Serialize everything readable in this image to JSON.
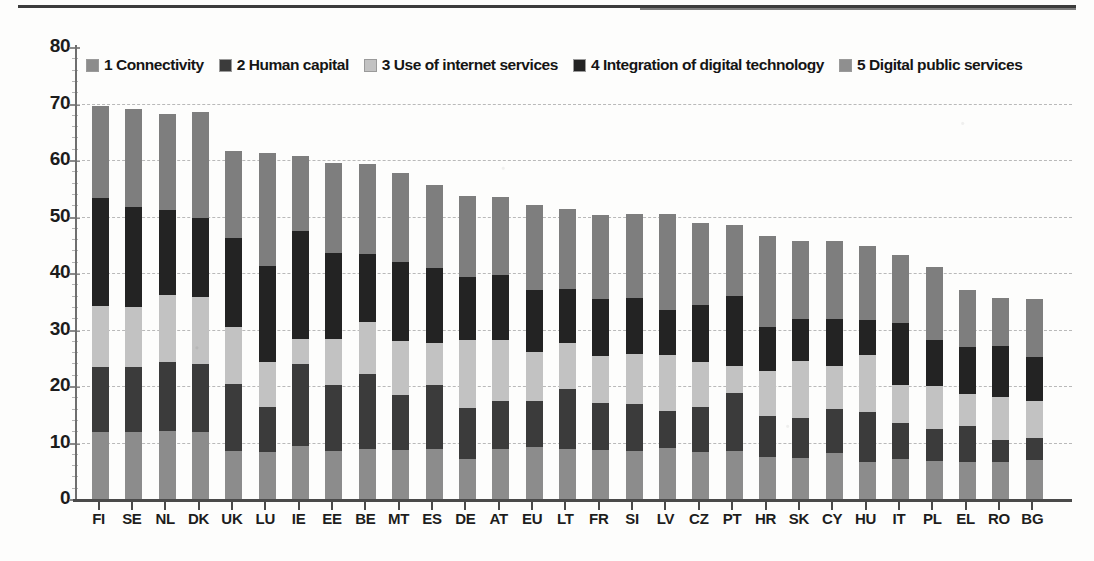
{
  "chart_data": {
    "type": "bar",
    "stacked": true,
    "title": "",
    "xlabel": "",
    "ylabel": "",
    "ylim": [
      0,
      80
    ],
    "yticks": [
      0,
      10,
      20,
      30,
      40,
      50,
      60,
      70,
      80
    ],
    "grid": true,
    "legend_position": "top-inside",
    "categories": [
      "FI",
      "SE",
      "NL",
      "DK",
      "UK",
      "LU",
      "IE",
      "EE",
      "BE",
      "MT",
      "ES",
      "DE",
      "AT",
      "EU",
      "LT",
      "FR",
      "SI",
      "LV",
      "CZ",
      "PT",
      "HR",
      "SK",
      "CY",
      "HU",
      "IT",
      "PL",
      "EL",
      "RO",
      "BG"
    ],
    "series": [
      {
        "name": "1 Connectivity",
        "color": "#8c8c8c",
        "values": [
          12.0,
          12.0,
          12.2,
          12.0,
          8.7,
          8.5,
          9.6,
          8.6,
          9.0,
          8.9,
          9.0,
          7.2,
          9.0,
          9.3,
          9.0,
          8.9,
          8.6,
          9.2,
          8.5,
          8.6,
          7.6,
          7.4,
          8.3,
          6.8,
          7.2,
          6.9,
          6.7,
          6.7,
          7.0
        ]
      },
      {
        "name": "2 Human capital",
        "color": "#3b3b3b",
        "values": [
          11.6,
          11.5,
          12.2,
          12.0,
          11.8,
          8.0,
          14.4,
          11.8,
          13.3,
          9.7,
          11.3,
          9.0,
          8.5,
          8.2,
          10.7,
          8.2,
          8.4,
          6.5,
          8.0,
          10.3,
          7.2,
          7.2,
          7.8,
          8.8,
          6.4,
          5.6,
          6.4,
          4.0,
          4.0
        ]
      },
      {
        "name": "3 Use of internet services",
        "color": "#c2c2c2",
        "values": [
          10.8,
          10.7,
          11.9,
          12.0,
          10.1,
          8.0,
          4.5,
          8.1,
          9.2,
          9.6,
          7.5,
          12.2,
          10.9,
          8.7,
          8.1,
          8.4,
          8.9,
          10.0,
          7.9,
          4.8,
          8.0,
          10.0,
          7.7,
          10.0,
          6.8,
          7.6,
          5.7,
          7.6,
          6.5
        ]
      },
      {
        "name": "4 Integration of digital technology",
        "color": "#232323",
        "values": [
          19.0,
          17.7,
          15.0,
          14.0,
          15.7,
          16.9,
          19.2,
          15.2,
          12.0,
          14.0,
          13.3,
          11.0,
          11.5,
          10.9,
          9.6,
          10.1,
          9.9,
          8.0,
          10.2,
          12.5,
          7.9,
          7.5,
          8.2,
          6.2,
          10.9,
          8.2,
          8.3,
          8.9,
          7.9
        ]
      },
      {
        "name": "5 Digital public services",
        "color": "#7e7e7e",
        "values": [
          16.3,
          17.3,
          17.1,
          18.6,
          15.5,
          20.1,
          13.2,
          16.0,
          16.0,
          15.6,
          14.7,
          14.4,
          13.8,
          15.1,
          14.2,
          14.8,
          14.9,
          16.9,
          14.5,
          12.5,
          16.1,
          13.8,
          13.9,
          13.1,
          12.0,
          12.9,
          10.1,
          8.5,
          10.2
        ]
      }
    ],
    "totals": [
      69.7,
      69.2,
      68.4,
      68.6,
      61.8,
      61.5,
      60.9,
      59.7,
      59.5,
      57.8,
      55.8,
      53.8,
      53.7,
      52.2,
      51.6,
      50.4,
      50.7,
      50.6,
      49.1,
      48.7,
      46.8,
      45.9,
      45.9,
      44.9,
      43.3,
      41.2,
      37.2,
      35.7,
      35.6
    ]
  },
  "legend": {
    "items": [
      {
        "label": "1 Connectivity"
      },
      {
        "label": "2 Human capital"
      },
      {
        "label": "3 Use of internet services"
      },
      {
        "label": "4 Integration of digital technology"
      },
      {
        "label": "5 Digital public services"
      }
    ]
  }
}
